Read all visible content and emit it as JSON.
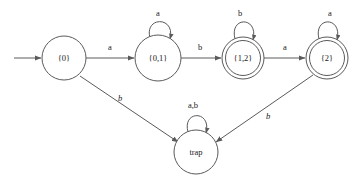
{
  "diagram": {
    "type": "finite-state-automaton",
    "title": "",
    "alphabet": [
      "a",
      "b"
    ],
    "start_state": "{0}",
    "accepting_states": [
      "{1,2}",
      "{2}"
    ],
    "states": [
      {
        "id": "s0",
        "label": "{0}",
        "cx": 64,
        "cy": 58,
        "r": 22,
        "accepting": false,
        "start": true
      },
      {
        "id": "s01",
        "label": "{0,1}",
        "cx": 158,
        "cy": 58,
        "r": 23,
        "accepting": false,
        "start": false
      },
      {
        "id": "s12",
        "label": "{1,2}",
        "cx": 243,
        "cy": 58,
        "r": 21,
        "accepting": true,
        "start": false
      },
      {
        "id": "s2",
        "label": "{2}",
        "cx": 327,
        "cy": 58,
        "r": 21,
        "accepting": true,
        "start": false
      },
      {
        "id": "trap",
        "label": "trap",
        "cx": 196,
        "cy": 152,
        "r": 22,
        "accepting": false,
        "start": false
      }
    ],
    "transitions": [
      {
        "id": "t1",
        "from": "s0",
        "to": "s01",
        "symbol": "a",
        "label_x": 110,
        "label_y": 48,
        "italic": false
      },
      {
        "id": "t2",
        "from": "s01",
        "to": "s12",
        "symbol": "b",
        "label_x": 200,
        "label_y": 48,
        "italic": false
      },
      {
        "id": "t3",
        "from": "s12",
        "to": "s2",
        "symbol": "a",
        "label_x": 285,
        "label_y": 48,
        "italic": false
      },
      {
        "id": "t4",
        "from": "s0",
        "to": "trap",
        "symbol": "b",
        "label_x": 120,
        "label_y": 99,
        "italic": true
      },
      {
        "id": "t5",
        "from": "s2",
        "to": "trap",
        "symbol": "b",
        "label_x": 268,
        "label_y": 117,
        "italic": true
      }
    ],
    "self_loops": [
      {
        "id": "l1",
        "state": "s01",
        "symbol": "a",
        "label_x": 158,
        "label_y": 14
      },
      {
        "id": "l2",
        "state": "s12",
        "symbol": "b",
        "label_x": 240,
        "label_y": 14
      },
      {
        "id": "l3",
        "state": "s2",
        "symbol": "a",
        "label_x": 330,
        "label_y": 14
      },
      {
        "id": "l4",
        "state": "trap",
        "symbol": "a,b",
        "label_x": 193,
        "label_y": 106
      }
    ],
    "colors": {
      "stroke": "#5a5a5a",
      "text": "#1a1a1a",
      "background": "#ffffff"
    }
  }
}
